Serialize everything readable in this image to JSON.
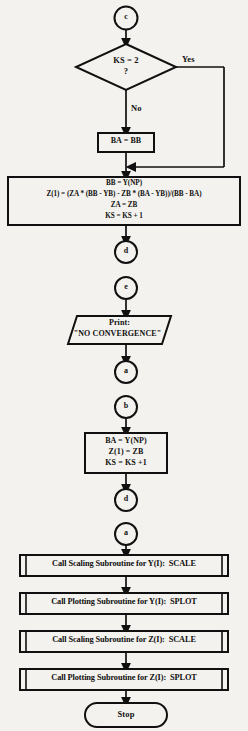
{
  "diagram": {
    "stroke_color": "#101010",
    "background_color": "#f4f2ee",
    "fill_color": "#f4f2ee"
  },
  "nodes": {
    "connector_c": {
      "label": "c"
    },
    "decision_ks2": {
      "line1": "KS = 2",
      "line2": "?"
    },
    "branch_yes": {
      "label": "Yes"
    },
    "branch_no": {
      "label": "No"
    },
    "process_ba_bb": {
      "line1": "BA = BB"
    },
    "process_main": {
      "line1": "BB = Y(NP)",
      "line2": "Z(1) = (ZA * (BB - YB) - ZB * (BA - YB))/(BB - BA)",
      "line3": "ZA = ZB",
      "line4": "KS = KS + 1"
    },
    "connector_d1": {
      "label": "d"
    },
    "connector_e": {
      "label": "e"
    },
    "io_print": {
      "line1": "Print:",
      "line2": "\"NO CONVERGENCE\""
    },
    "connector_a1": {
      "label": "a"
    },
    "connector_b": {
      "label": "b"
    },
    "process_second": {
      "line1": "BA = Y(NP)",
      "line2": "Z(1) = ZB",
      "line3": "KS = KS +1"
    },
    "connector_d2": {
      "label": "d"
    },
    "connector_a2": {
      "label": "a"
    },
    "subroutine_scale_y": {
      "label": "Call Scaling Subroutine for Y(I):  SCALE"
    },
    "subroutine_splot_y": {
      "label": "Call Plotting Subroutine for Y(I):  SPLOT"
    },
    "subroutine_scale_z": {
      "label": "Call Scaling Subroutine for Z(I):  SCALE"
    },
    "subroutine_splot_z": {
      "label": "Call Plotting Subroutine for Z(I):  SPLOT"
    },
    "terminator_stop": {
      "label": "Stop"
    }
  }
}
